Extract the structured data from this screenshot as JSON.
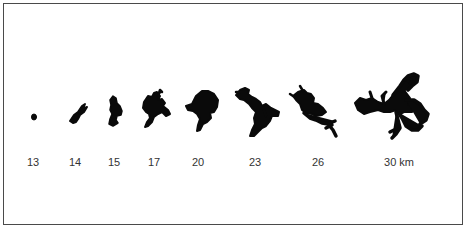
{
  "figure": {
    "unit": "km",
    "stages": [
      {
        "label": "13",
        "x": 33
      },
      {
        "label": "14",
        "x": 75
      },
      {
        "label": "15",
        "x": 114
      },
      {
        "label": "17",
        "x": 154
      },
      {
        "label": "20",
        "x": 198
      },
      {
        "label": "23",
        "x": 255
      },
      {
        "label": "26",
        "x": 318
      },
      {
        "label": "30 km",
        "x": 399
      }
    ]
  }
}
